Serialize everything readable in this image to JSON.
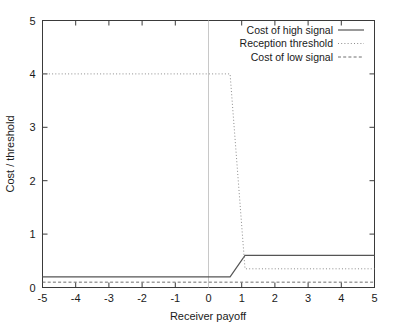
{
  "chart_data": {
    "type": "line",
    "title": "",
    "xlabel": "Receiver payoff",
    "ylabel": "Cost / threshold",
    "xlim": [
      -5,
      5
    ],
    "ylim": [
      0,
      5
    ],
    "xticks": [
      "-5",
      "-4",
      "-3",
      "-2",
      "-1",
      "0",
      "1",
      "2",
      "3",
      "4",
      "5"
    ],
    "xtick_values": [
      -5,
      -4,
      -3,
      -2,
      -1,
      0,
      1,
      2,
      3,
      4,
      5
    ],
    "yticks": [
      "0",
      "1",
      "2",
      "3",
      "4",
      "5"
    ],
    "ytick_values": [
      0,
      1,
      2,
      3,
      4,
      5
    ],
    "grid": false,
    "legend_position": "top-right",
    "vertical_marker_x": 0,
    "series": [
      {
        "name": "Cost of high signal",
        "style": "solid",
        "color": "#555555",
        "x": [
          -5,
          0.65,
          1.1,
          5
        ],
        "values": [
          0.2,
          0.2,
          0.6,
          0.6
        ]
      },
      {
        "name": "Reception threshold",
        "style": "dotted",
        "color": "#8c8c8c",
        "x": [
          -5,
          0.65,
          1.1,
          5
        ],
        "values": [
          4.0,
          4.0,
          0.35,
          0.35
        ]
      },
      {
        "name": "Cost of low signal",
        "style": "dashed",
        "color": "#6e6e6e",
        "x": [
          -5,
          5
        ],
        "values": [
          0.1,
          0.1
        ]
      }
    ]
  },
  "legend": {
    "entries": [
      {
        "label": "Cost of high signal"
      },
      {
        "label": "Reception threshold"
      },
      {
        "label": "Cost of low signal"
      }
    ]
  }
}
